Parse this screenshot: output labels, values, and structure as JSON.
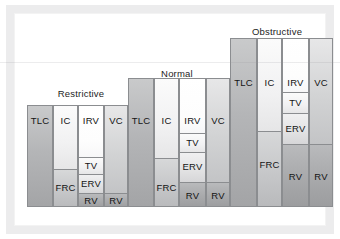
{
  "figure": {
    "baseline_y": 207,
    "frame_color": "#ececed",
    "outline_color": "#8b8d90"
  },
  "chart_data": {
    "type": "bar",
    "title": "",
    "xlabel": "",
    "ylabel": "",
    "grid": false,
    "legend": "none",
    "orientation": "vertical-stacked",
    "categories": [
      "Restrictive",
      "Normal",
      "Obstructive"
    ],
    "series_labels": [
      "TLC",
      "IC",
      "IRV",
      "TV",
      "ERV",
      "VC",
      "RV",
      "FRC"
    ],
    "note": "Each group shows 4 adjacent columns. Column 1 = TLC (total lung capacity). Column 2 = IC over FRC. Column 3 = IRV / TV / ERV / RV. Column 4 = VC over RV. Values in px of bar height measured from the shared baseline.",
    "groups": [
      {
        "name": "Restrictive",
        "title_x": 50,
        "title_y": 88,
        "title_w": 62,
        "top": 105,
        "columns": [
          {
            "name": "col-tlc",
            "x": 27,
            "width": 26,
            "top": 105,
            "segments": [
              {
                "label": "TLC",
                "top": 105,
                "height": 102,
                "fill": "f-dark",
                "label_y_center": 120,
                "sep": false
              }
            ]
          },
          {
            "name": "col-ic-frc",
            "x": 53,
            "width": 25,
            "top": 105,
            "segments": [
              {
                "label": "IC",
                "top": 105,
                "height": 63,
                "fill": "f-light",
                "label_y_center": 120,
                "sep": false
              },
              {
                "label": "FRC",
                "top": 168,
                "height": 39,
                "fill": "f-frc",
                "label_y_center": 186,
                "sep": true
              }
            ]
          },
          {
            "name": "col-irv-tv-erv-rv",
            "x": 78,
            "width": 26,
            "top": 105,
            "segments": [
              {
                "label": "IRV",
                "top": 105,
                "height": 51,
                "fill": "f-white",
                "label_y_center": 120,
                "sep": false
              },
              {
                "label": "TV",
                "top": 156,
                "height": 17,
                "fill": "f-light",
                "label_y_center": 164,
                "sep": true
              },
              {
                "label": "ERV",
                "top": 173,
                "height": 19,
                "fill": "f-erv",
                "label_y_center": 182,
                "sep": true
              },
              {
                "label": "RV",
                "top": 192,
                "height": 15,
                "fill": "f-rv",
                "label_y_center": 199,
                "sep": true
              }
            ]
          },
          {
            "name": "col-vc-rv",
            "x": 104,
            "width": 24,
            "top": 105,
            "segments": [
              {
                "label": "VC",
                "top": 105,
                "height": 87,
                "fill": "f-mid",
                "label_y_center": 120,
                "sep": false
              },
              {
                "label": "RV",
                "top": 192,
                "height": 15,
                "fill": "f-rv",
                "label_y_center": 199,
                "sep": true
              }
            ]
          }
        ]
      },
      {
        "name": "Normal",
        "title_x": 152,
        "title_y": 68,
        "title_w": 50,
        "top": 78,
        "columns": [
          {
            "name": "col-tlc",
            "x": 128,
            "width": 26,
            "top": 78,
            "segments": [
              {
                "label": "TLC",
                "top": 78,
                "height": 129,
                "fill": "f-dark",
                "label_y_center": 120,
                "sep": false
              }
            ]
          },
          {
            "name": "col-ic-frc",
            "x": 154,
            "width": 25,
            "top": 78,
            "segments": [
              {
                "label": "IC",
                "top": 78,
                "height": 79,
                "fill": "f-light",
                "label_y_center": 120,
                "sep": false
              },
              {
                "label": "FRC",
                "top": 157,
                "height": 50,
                "fill": "f-frc",
                "label_y_center": 186,
                "sep": true
              }
            ]
          },
          {
            "name": "col-irv-tv-erv-rv",
            "x": 179,
            "width": 27,
            "top": 78,
            "segments": [
              {
                "label": "IRV",
                "top": 78,
                "height": 54,
                "fill": "f-white",
                "label_y_center": 120,
                "sep": false
              },
              {
                "label": "TV",
                "top": 132,
                "height": 19,
                "fill": "f-light",
                "label_y_center": 141,
                "sep": true
              },
              {
                "label": "ERV",
                "top": 151,
                "height": 30,
                "fill": "f-erv",
                "label_y_center": 165,
                "sep": true
              },
              {
                "label": "RV",
                "top": 181,
                "height": 26,
                "fill": "f-rv",
                "label_y_center": 194,
                "sep": true
              }
            ]
          },
          {
            "name": "col-vc-rv",
            "x": 206,
            "width": 24,
            "top": 78,
            "segments": [
              {
                "label": "VC",
                "top": 78,
                "height": 103,
                "fill": "f-mid",
                "label_y_center": 120,
                "sep": false
              },
              {
                "label": "RV",
                "top": 181,
                "height": 26,
                "fill": "f-rv",
                "label_y_center": 194,
                "sep": true
              }
            ]
          }
        ]
      },
      {
        "name": "Obstructive",
        "title_x": 244,
        "title_y": 26,
        "title_w": 66,
        "top": 38,
        "columns": [
          {
            "name": "col-tlc",
            "x": 230,
            "width": 27,
            "top": 38,
            "segments": [
              {
                "label": "TLC",
                "top": 38,
                "height": 169,
                "fill": "f-dark",
                "label_y_center": 82,
                "sep": false
              }
            ]
          },
          {
            "name": "col-ic-frc",
            "x": 257,
            "width": 25,
            "top": 38,
            "segments": [
              {
                "label": "IC",
                "top": 38,
                "height": 92,
                "fill": "f-light",
                "label_y_center": 82,
                "sep": false
              },
              {
                "label": "FRC",
                "top": 130,
                "height": 77,
                "fill": "f-frc",
                "label_y_center": 163,
                "sep": true
              }
            ]
          },
          {
            "name": "col-irv-tv-erv-rv",
            "x": 282,
            "width": 27,
            "top": 38,
            "segments": [
              {
                "label": "IRV",
                "top": 38,
                "height": 53,
                "fill": "f-white",
                "label_y_center": 82,
                "sep": false
              },
              {
                "label": "TV",
                "top": 91,
                "height": 21,
                "fill": "f-light",
                "label_y_center": 101,
                "sep": true
              },
              {
                "label": "ERV",
                "top": 112,
                "height": 31,
                "fill": "f-erv",
                "label_y_center": 127,
                "sep": true
              },
              {
                "label": "RV",
                "top": 143,
                "height": 64,
                "fill": "f-rv",
                "label_y_center": 175,
                "sep": true
              }
            ]
          },
          {
            "name": "col-vc-rv",
            "x": 309,
            "width": 24,
            "top": 38,
            "segments": [
              {
                "label": "VC",
                "top": 38,
                "height": 105,
                "fill": "f-mid",
                "label_y_center": 82,
                "sep": false
              },
              {
                "label": "RV",
                "top": 143,
                "height": 64,
                "fill": "f-rv",
                "label_y_center": 175,
                "sep": true
              }
            ]
          }
        ]
      }
    ]
  }
}
